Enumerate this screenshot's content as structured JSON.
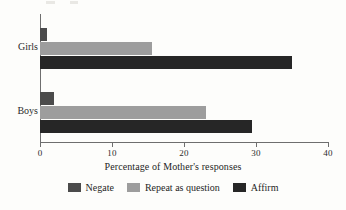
{
  "chart_data": {
    "type": "bar",
    "orientation": "horizontal",
    "title": "",
    "xlabel": "Percentage of Mother's responses",
    "ylabel": "",
    "xlim": [
      0,
      40
    ],
    "xticks": [
      0,
      10,
      20,
      30,
      40
    ],
    "xtick_labels": [
      "0",
      "10",
      "20",
      "30",
      "40"
    ],
    "grid": false,
    "legend_position": "bottom",
    "categories": [
      "Girls",
      "Boys"
    ],
    "series": [
      {
        "name": "Negate",
        "color": "#4b4b4b",
        "values": [
          1,
          2
        ]
      },
      {
        "name": "Repeat as question",
        "color": "#9d9d9d",
        "values": [
          15.5,
          23
        ]
      },
      {
        "name": "Affirm",
        "color": "#262626",
        "values": [
          35,
          29.4
        ]
      }
    ]
  },
  "legend": {
    "items": [
      {
        "label": "Negate"
      },
      {
        "label": "Repeat as question"
      },
      {
        "label": "Affirm"
      }
    ]
  }
}
